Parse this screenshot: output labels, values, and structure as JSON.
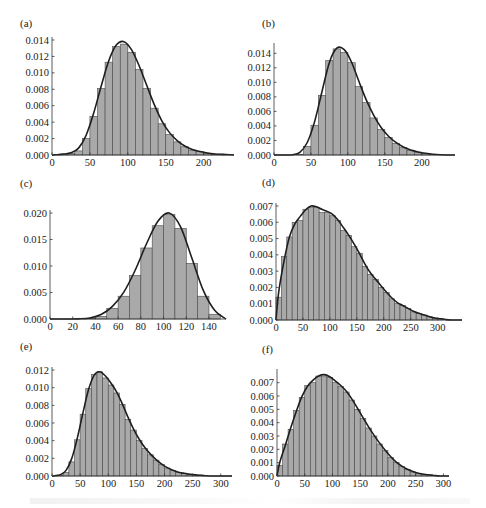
{
  "figure": {
    "panels": [
      "(a)",
      "(b)",
      "(c)",
      "(d)",
      "(e)",
      "(f)"
    ]
  },
  "chart_data": [
    {
      "id": "a",
      "label": "(a)",
      "type": "bar",
      "title": "",
      "xlabel": "",
      "ylabel": "",
      "xlim": [
        0,
        240
      ],
      "ylim": [
        0,
        0.014
      ],
      "xticks": [
        0,
        50,
        100,
        150,
        200
      ],
      "yticks": [
        "0.000",
        "0.002",
        "0.004",
        "0.006",
        "0.008",
        "0.010",
        "0.012",
        "0.014"
      ],
      "bin_width": 10,
      "bins_start": [
        0,
        10,
        20,
        30,
        40,
        50,
        60,
        70,
        80,
        90,
        100,
        110,
        120,
        130,
        140,
        150,
        160,
        170,
        180,
        190,
        200,
        210,
        220,
        230
      ],
      "values": [
        0.0,
        0.0001,
        0.0002,
        0.0005,
        0.002,
        0.0047,
        0.0081,
        0.0113,
        0.0132,
        0.0135,
        0.0125,
        0.0104,
        0.0081,
        0.0057,
        0.0038,
        0.0025,
        0.0016,
        0.001,
        0.0006,
        0.0004,
        0.0002,
        0.0001,
        0.0001,
        0.0
      ],
      "curve": {
        "type": "fitted density",
        "peak_x": 95,
        "peak_y": 0.0138
      },
      "grid": false,
      "legend": null
    },
    {
      "id": "b",
      "label": "(b)",
      "type": "bar",
      "title": "",
      "xlabel": "",
      "ylabel": "",
      "xlim": [
        0,
        245
      ],
      "ylim": [
        0,
        0.015
      ],
      "xticks": [
        0,
        50,
        100,
        150,
        200
      ],
      "yticks": [
        "0.000",
        "0.002",
        "0.004",
        "0.006",
        "0.008",
        "0.010",
        "0.012",
        "0.014"
      ],
      "bin_width": 10,
      "bins_start": [
        0,
        10,
        20,
        30,
        40,
        50,
        60,
        70,
        80,
        90,
        100,
        110,
        120,
        130,
        140,
        150,
        160,
        170,
        180,
        190,
        200,
        210,
        220,
        230
      ],
      "values": [
        0.0,
        0.0,
        0.0,
        0.0001,
        0.0012,
        0.0041,
        0.0082,
        0.013,
        0.0146,
        0.0141,
        0.0127,
        0.0094,
        0.0072,
        0.0051,
        0.0035,
        0.0024,
        0.0016,
        0.001,
        0.0006,
        0.0004,
        0.0002,
        0.0001,
        0.0,
        0.0
      ],
      "curve": {
        "type": "fitted density",
        "peak_x": 90,
        "peak_y": 0.0147
      },
      "grid": false,
      "legend": null
    },
    {
      "id": "c",
      "label": "(c)",
      "type": "bar",
      "title": "",
      "xlabel": "",
      "ylabel": "",
      "xlim": [
        0,
        155
      ],
      "ylim": [
        0,
        0.02
      ],
      "xticks": [
        0,
        20,
        40,
        60,
        80,
        100,
        120,
        140
      ],
      "yticks": [
        "0.000",
        "0.005",
        "0.010",
        "0.015",
        "0.020"
      ],
      "bin_width": 10,
      "bins_start": [
        0,
        10,
        20,
        30,
        40,
        50,
        60,
        70,
        80,
        90,
        100,
        110,
        120,
        130,
        140
      ],
      "values": [
        0.0,
        0.0,
        0.0,
        0.0001,
        0.0005,
        0.002,
        0.0043,
        0.0082,
        0.0134,
        0.0176,
        0.0197,
        0.0171,
        0.0105,
        0.0043,
        0.0009
      ],
      "curve": {
        "type": "fitted density",
        "peak_x": 105,
        "peak_y": 0.02
      },
      "grid": false,
      "legend": null
    },
    {
      "id": "d",
      "label": "(d)",
      "type": "bar",
      "title": "",
      "xlabel": "",
      "ylabel": "",
      "xlim": [
        0,
        345
      ],
      "ylim": [
        0,
        0.007
      ],
      "xticks": [
        0,
        50,
        100,
        150,
        200,
        250,
        300
      ],
      "yticks": [
        "0.000",
        "0.001",
        "0.002",
        "0.003",
        "0.004",
        "0.005",
        "0.006",
        "0.007"
      ],
      "bin_width": 10,
      "bins_start": [
        0,
        10,
        20,
        30,
        40,
        50,
        60,
        70,
        80,
        90,
        100,
        110,
        120,
        130,
        140,
        150,
        160,
        170,
        180,
        190,
        200,
        210,
        220,
        230,
        240,
        250,
        260,
        270,
        280,
        290,
        300,
        310,
        320,
        330
      ],
      "values": [
        0.0014,
        0.0039,
        0.0051,
        0.006,
        0.0061,
        0.0068,
        0.0069,
        0.0069,
        0.0066,
        0.0066,
        0.0064,
        0.0061,
        0.0055,
        0.0052,
        0.0045,
        0.0041,
        0.0033,
        0.0028,
        0.0025,
        0.002,
        0.0017,
        0.0013,
        0.001,
        0.0009,
        0.0007,
        0.0005,
        0.0004,
        0.0003,
        0.0002,
        0.0001,
        0.0001,
        0.0,
        0.0,
        0.0
      ],
      "curve": {
        "type": "fitted density",
        "peak_x": 72,
        "peak_y": 0.007
      },
      "grid": false,
      "legend": null
    },
    {
      "id": "e",
      "label": "(e)",
      "type": "bar",
      "title": "",
      "xlabel": "",
      "ylabel": "",
      "xlim": [
        0,
        320
      ],
      "ylim": [
        0,
        0.012
      ],
      "xticks": [
        0,
        50,
        100,
        150,
        200,
        250,
        300
      ],
      "yticks": [
        "0.000",
        "0.002",
        "0.004",
        "0.006",
        "0.008",
        "0.010",
        "0.012"
      ],
      "bin_width": 10,
      "bins_start": [
        0,
        10,
        20,
        30,
        40,
        50,
        60,
        70,
        80,
        90,
        100,
        110,
        120,
        130,
        140,
        150,
        160,
        170,
        180,
        190,
        200,
        210,
        220,
        230,
        240,
        250,
        260,
        270,
        280,
        290,
        300,
        310
      ],
      "values": [
        0.0,
        0.0001,
        0.0004,
        0.0016,
        0.0041,
        0.007,
        0.0099,
        0.0115,
        0.0118,
        0.0111,
        0.0103,
        0.0094,
        0.0081,
        0.0064,
        0.0052,
        0.004,
        0.0031,
        0.0024,
        0.0018,
        0.0013,
        0.0009,
        0.0006,
        0.0004,
        0.0003,
        0.0002,
        0.0001,
        0.0001,
        0.0,
        0.0,
        0.0,
        0.0,
        0.0
      ],
      "curve": {
        "type": "fitted density",
        "peak_x": 85,
        "peak_y": 0.0118
      },
      "grid": false,
      "legend": null
    },
    {
      "id": "f",
      "label": "(f)",
      "type": "bar",
      "title": "",
      "xlabel": "",
      "ylabel": "",
      "xlim": [
        0,
        310
      ],
      "ylim": [
        0,
        0.0078
      ],
      "xticks": [
        0,
        50,
        100,
        150,
        200,
        250,
        300
      ],
      "yticks": [
        "0.000",
        "0.001",
        "0.002",
        "0.003",
        "0.004",
        "0.005",
        "0.006",
        "0.007"
      ],
      "bin_width": 10,
      "bins_start": [
        0,
        10,
        20,
        30,
        40,
        50,
        60,
        70,
        80,
        90,
        100,
        110,
        120,
        130,
        140,
        150,
        160,
        170,
        180,
        190,
        200,
        210,
        220,
        230,
        240,
        250,
        260,
        270,
        280,
        290
      ],
      "values": [
        0.0008,
        0.0024,
        0.0035,
        0.0049,
        0.0059,
        0.0068,
        0.007,
        0.0075,
        0.0075,
        0.0074,
        0.007,
        0.0067,
        0.0063,
        0.0057,
        0.005,
        0.0043,
        0.0036,
        0.003,
        0.0024,
        0.0019,
        0.0014,
        0.001,
        0.0007,
        0.0005,
        0.0003,
        0.0002,
        0.0001,
        0.0001,
        0.0,
        0.0
      ],
      "curve": {
        "type": "fitted density",
        "peak_x": 85,
        "peak_y": 0.0076
      },
      "grid": false,
      "legend": null
    }
  ]
}
